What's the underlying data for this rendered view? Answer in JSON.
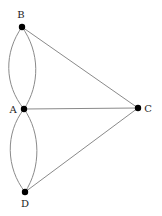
{
  "diagram": {
    "type": "multigraph",
    "nodes": [
      {
        "id": "B",
        "label": "B",
        "x": 22,
        "y": 27,
        "label_x": 21,
        "label_y": 18
      },
      {
        "id": "A",
        "label": "A",
        "x": 24,
        "y": 109,
        "label_x": 13,
        "label_y": 113
      },
      {
        "id": "C",
        "label": "C",
        "x": 138,
        "y": 108,
        "label_x": 148,
        "label_y": 112
      },
      {
        "id": "D",
        "label": "D",
        "x": 25,
        "y": 192,
        "label_x": 25,
        "label_y": 207
      }
    ],
    "edges": [
      {
        "from": "A",
        "to": "B",
        "curve": "left"
      },
      {
        "from": "A",
        "to": "B",
        "curve": "right"
      },
      {
        "from": "A",
        "to": "D",
        "curve": "left"
      },
      {
        "from": "A",
        "to": "D",
        "curve": "right"
      },
      {
        "from": "A",
        "to": "C",
        "curve": "straight"
      },
      {
        "from": "B",
        "to": "C",
        "curve": "straight"
      },
      {
        "from": "D",
        "to": "C",
        "curve": "straight"
      }
    ],
    "colors": {
      "edge": "#8a8a8a",
      "node": "#000000",
      "label": "#222222"
    }
  }
}
